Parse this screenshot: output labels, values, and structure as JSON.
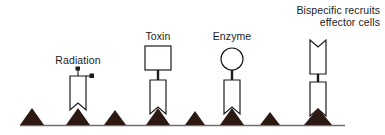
{
  "figure": {
    "width": 385,
    "height": 135,
    "background_color": "#ffffff"
  },
  "colors": {
    "outline": "#1b1b1b",
    "text": "#1b1b1b",
    "antigen_fill": "#2c1a12",
    "baseline": "#6e6e6e",
    "shape_fill": "#ffffff"
  },
  "labels": {
    "radiation": "Radiation",
    "toxin": "Toxin",
    "enzyme": "Enzyme",
    "bispecific_line1": "Bispecific recruits",
    "bispecific_line2": "effector cells"
  },
  "constructs": [
    {
      "id": "radiation",
      "label": "Radiation",
      "payload": "radiolabel-dots",
      "payload_count": 2,
      "antibody_notch": "bottom",
      "x": 78
    },
    {
      "id": "toxin",
      "label": "Toxin",
      "payload": "square",
      "payload_count": 1,
      "antibody_notch": "bottom",
      "x": 158
    },
    {
      "id": "enzyme",
      "label": "Enzyme",
      "payload": "circle",
      "payload_count": 1,
      "antibody_notch": "bottom",
      "x": 232
    },
    {
      "id": "bispecific",
      "label": "Bispecific recruits effector cells",
      "payload": "antibody",
      "payload_count": 1,
      "antibody_notch": "bottom",
      "x": 318
    }
  ],
  "membrane": {
    "baseline_y": 125,
    "baseline_x_start": 20,
    "baseline_x_end": 345,
    "antigen_count": 8,
    "antigen_x": [
      32,
      78,
      115,
      158,
      195,
      232,
      270,
      318
    ]
  }
}
